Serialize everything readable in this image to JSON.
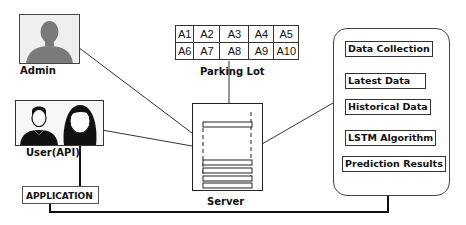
{
  "diagram": {
    "actors": {
      "admin": {
        "label": "Admin",
        "icon": "admin-silhouette-icon"
      },
      "users": {
        "label": "User(API)",
        "icon": "users-male-female-icon"
      }
    },
    "application": {
      "label": "APPLICATION"
    },
    "parking_lot": {
      "label": "Parking Lot",
      "rows": [
        [
          "A1",
          "A2",
          "A3",
          "A4",
          "A5"
        ],
        [
          "A6",
          "A7",
          "A8",
          "A9",
          "A10"
        ]
      ]
    },
    "server": {
      "label": "Server",
      "icon": "server-document-icon"
    },
    "pipeline": {
      "steps": [
        "Data Collection",
        "Latest Data",
        "Historical Data",
        "LSTM Algorithm",
        "Prediction Results"
      ]
    },
    "colors": {
      "line": "#222222",
      "admin_fill": "#7a7a7a",
      "user_fill": "#111111"
    }
  }
}
